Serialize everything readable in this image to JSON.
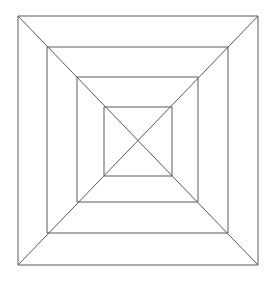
{
  "figure": {
    "canvas": {
      "width": 276,
      "height": 281,
      "background_color": "#ffffff"
    },
    "style": {
      "stroke_color": "#5a5a5a",
      "stroke_width": 1,
      "fill": "none"
    },
    "center": {
      "x": 138,
      "y": 140.5
    },
    "squares": [
      {
        "name": "outer-square",
        "index": 1,
        "x1": 18,
        "y1": 16,
        "x2": 258,
        "y2": 265,
        "width": 240,
        "height": 249
      },
      {
        "name": "second-square",
        "index": 2,
        "x1": 47,
        "y1": 47,
        "x2": 228,
        "y2": 233,
        "width": 181,
        "height": 186
      },
      {
        "name": "third-square",
        "index": 3,
        "x1": 77,
        "y1": 77,
        "x2": 198,
        "y2": 202,
        "width": 121,
        "height": 125
      },
      {
        "name": "inner-square",
        "index": 4,
        "x1": 104,
        "y1": 107,
        "x2": 172,
        "y2": 176,
        "width": 68,
        "height": 69
      }
    ],
    "diagonals": [
      {
        "name": "diagonal-tl-br",
        "x1": 18,
        "y1": 16,
        "x2": 258,
        "y2": 265
      },
      {
        "name": "diagonal-tr-bl",
        "x1": 258,
        "y1": 16,
        "x2": 18,
        "y2": 265
      }
    ]
  }
}
